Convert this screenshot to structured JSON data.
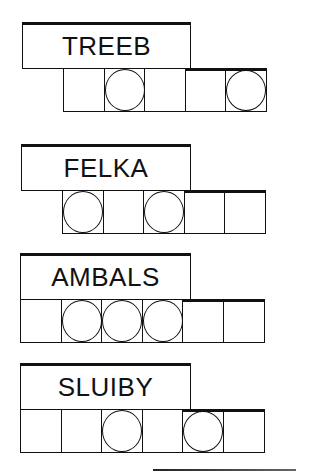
{
  "puzzles": [
    {
      "scrambled": "TREEB",
      "cells": [
        false,
        true,
        false,
        false,
        true
      ]
    },
    {
      "scrambled": "FELKA",
      "cells": [
        true,
        false,
        true,
        false,
        false
      ]
    },
    {
      "scrambled": "AMBALS",
      "cells": [
        false,
        true,
        true,
        true,
        false,
        false
      ]
    },
    {
      "scrambled": "SLUIBY",
      "cells": [
        false,
        false,
        true,
        false,
        true,
        false
      ]
    }
  ],
  "colors": {
    "ink": "#111111",
    "background": "#ffffff"
  }
}
